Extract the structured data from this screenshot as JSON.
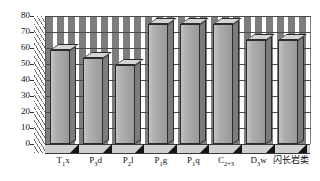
{
  "chart_data": {
    "type": "bar",
    "title": "",
    "subtitle": "",
    "xlabel": "",
    "ylabel": "",
    "ylim": [
      0,
      80
    ],
    "ytick_step": 10,
    "grid": true,
    "legend": null,
    "legend_position": "none",
    "style": "3d-column",
    "categories": [
      "T₁x",
      "P₃d",
      "P₂l",
      "P₁g",
      "P₁q",
      "C₂₊₃",
      "D₃w",
      "闪长岩类"
    ],
    "category_parts": [
      {
        "base": "T",
        "sub": "1",
        "tail": "x"
      },
      {
        "base": "P",
        "sub": "3",
        "tail": "d"
      },
      {
        "base": "P",
        "sub": "2",
        "tail": "l"
      },
      {
        "base": "P",
        "sub": "1",
        "tail": "g"
      },
      {
        "base": "P",
        "sub": "1",
        "tail": "q"
      },
      {
        "base": "C",
        "sub": "2+3",
        "tail": ""
      },
      {
        "base": "D",
        "sub": "3",
        "tail": "w"
      },
      {
        "base": "闪长岩类",
        "sub": "",
        "tail": ""
      }
    ],
    "values": [
      59,
      54,
      49.5,
      75,
      75,
      75,
      65,
      65
    ],
    "ytick_labels": [
      "0",
      "10",
      "20",
      "30",
      "40",
      "50",
      "60",
      "70",
      "80"
    ],
    "ytick_values": [
      0,
      10,
      20,
      30,
      40,
      50,
      60,
      70,
      80
    ],
    "colors": {
      "bar_front": "#a6a6a6",
      "bar_top": "#d4d4d4",
      "bar_side": "#7c7c7c",
      "bar_outline": "#2c2c2c",
      "gridline": "#4a4a4a",
      "wall_hatch": "#6e6e6e",
      "floor": "#cfcfcf",
      "foot_shadow": "#141414",
      "text": "#111111",
      "background": "#ffffff"
    }
  }
}
